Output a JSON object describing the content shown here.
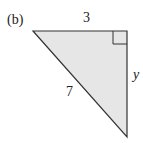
{
  "figure": {
    "part_label": "(b)",
    "shape": "right-triangle",
    "fill_color": "#e6e6e6",
    "stroke_color": "#333333",
    "sides": {
      "top": "3",
      "right": "y",
      "hypotenuse": "7"
    },
    "right_angle_marker": "top-right"
  }
}
